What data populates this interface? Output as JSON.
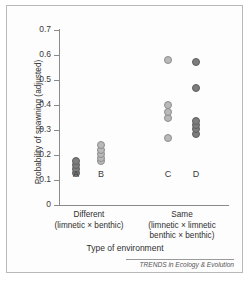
{
  "figure": {
    "credit": "TRENDS in Ecology & Evolution"
  },
  "chart_data": {
    "type": "scatter",
    "title": "",
    "xlabel": "Type of environment",
    "ylabel": "Probability of spawning (adjusted)",
    "ylim": [
      0,
      0.7
    ],
    "ytick_labels": [
      "0",
      "0.1",
      "0.2",
      "0.3",
      "0.4",
      "0.5",
      "0.6",
      "0.7"
    ],
    "ytick_values": [
      0,
      0.1,
      0.2,
      0.3,
      0.4,
      0.5,
      0.6,
      0.7
    ],
    "grid": false,
    "legend": "none",
    "x_categories": [
      {
        "name": "Different",
        "main": "Different",
        "sub": "(limnetic × benthic)",
        "sub2": ""
      },
      {
        "name": "Same",
        "main": "Same",
        "sub": "(limnetic × limnetic",
        "sub2": "benthic × benthic)"
      }
    ],
    "groups": [
      {
        "label": "A",
        "category": "Different",
        "marker_shade": "dark",
        "values": [
          0.13,
          0.145,
          0.16,
          0.175
        ]
      },
      {
        "label": "B",
        "category": "Different",
        "marker_shade": "light",
        "values": [
          0.175,
          0.19,
          0.205,
          0.222,
          0.24
        ]
      },
      {
        "label": "C",
        "category": "Same",
        "marker_shade": "light",
        "values": [
          0.268,
          0.347,
          0.372,
          0.4,
          0.582
        ]
      },
      {
        "label": "D",
        "category": "Same",
        "marker_shade": "dark",
        "values": [
          0.283,
          0.303,
          0.32,
          0.337,
          0.468,
          0.571
        ]
      }
    ],
    "colors": {
      "marker_light": "#b9b9b9",
      "marker_dark": "#7d7d7d",
      "axis": "#8a8a8a",
      "text": "#2f2f2f",
      "background": "#ffffff"
    }
  }
}
